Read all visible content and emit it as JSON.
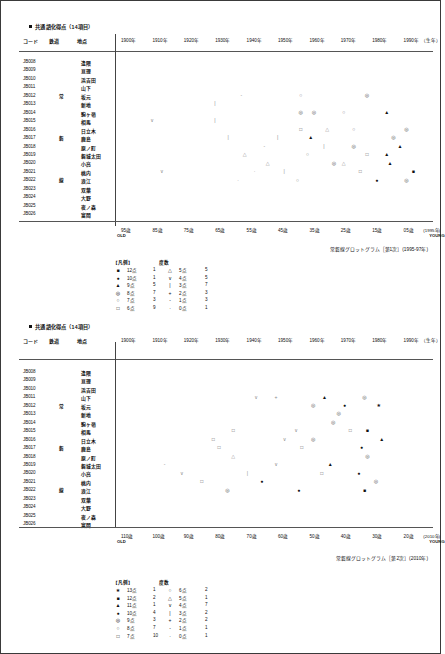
{
  "document": {
    "sections": [
      {
        "id": "sec1",
        "title": "共通語化得点（14項目）",
        "bullet_icon": "filled-square",
        "columns": {
          "code": "コード",
          "railway": "鉄道",
          "place": "地点"
        },
        "year_axis": [
          "1900年",
          "1910年",
          "1920年",
          "1930年",
          "1940年",
          "1950年",
          "1960年",
          "1970年",
          "1980年",
          "1990年"
        ],
        "year_axis_note": "（生年）",
        "age_axis": [
          "95歳",
          "85歳",
          "75歳",
          "65歳",
          "55歳",
          "45歳",
          "35歳",
          "25歳",
          "15歳",
          "05歳"
        ],
        "age_axis_note": "(1995年)",
        "old_label": "OLD",
        "young_label": "YOUNG",
        "caption": "常磐線グロットグラム［第1次］(1995-97年)",
        "rows": [
          {
            "code": "JB008",
            "railway": "",
            "place": "逢隈"
          },
          {
            "code": "JB009",
            "railway": "",
            "place": "亘理"
          },
          {
            "code": "JB010",
            "railway": "",
            "place": "浜吉田"
          },
          {
            "code": "JB011",
            "railway": "",
            "place": "山下"
          },
          {
            "code": "JB012",
            "railway": "常",
            "place": "坂元"
          },
          {
            "code": "JB013",
            "railway": "",
            "place": "新地"
          },
          {
            "code": "JB014",
            "railway": "",
            "place": "駒ヶ嶺"
          },
          {
            "code": "JB015",
            "railway": "",
            "place": "相馬"
          },
          {
            "code": "JB016",
            "railway": "",
            "place": "日立木"
          },
          {
            "code": "JB017",
            "railway": "磐",
            "place": "鹿島"
          },
          {
            "code": "JB018",
            "railway": "",
            "place": "原ノ町"
          },
          {
            "code": "JB019",
            "railway": "",
            "place": "磐城太田"
          },
          {
            "code": "JB020",
            "railway": "",
            "place": "小高"
          },
          {
            "code": "JB021",
            "railway": "",
            "place": "桃内"
          },
          {
            "code": "JB022",
            "railway": "線",
            "place": "浪江"
          },
          {
            "code": "JB023",
            "railway": "",
            "place": "双葉"
          },
          {
            "code": "JB024",
            "railway": "",
            "place": "大野"
          },
          {
            "code": "JB025",
            "railway": "",
            "place": "夜ノ森"
          },
          {
            "code": "JB026",
            "railway": "",
            "place": "富岡"
          }
        ],
        "legend": {
          "header_label": "【凡例】",
          "header_count": "度数",
          "entries": [
            {
              "symbol": "■",
              "score": "12点",
              "count": "1"
            },
            {
              "symbol": "●",
              "score": "10点",
              "count": "1"
            },
            {
              "symbol": "▲",
              "score": "9点",
              "count": "5"
            },
            {
              "symbol": "◎",
              "score": "8点",
              "count": "7"
            },
            {
              "symbol": "○",
              "score": "7点",
              "count": "3"
            },
            {
              "symbol": "□",
              "score": "6点",
              "count": "9"
            },
            {
              "symbol": "△",
              "score": "5点",
              "count": "5"
            },
            {
              "symbol": "∨",
              "score": "4点",
              "count": "5"
            },
            {
              "symbol": "|",
              "score": "3点",
              "count": "7"
            },
            {
              "symbol": "+",
              "score": "2点",
              "count": "3"
            },
            {
              "symbol": "-",
              "score": "1点",
              "count": "3"
            },
            {
              "symbol": "·",
              "score": "0点",
              "count": "1"
            }
          ]
        }
      },
      {
        "id": "sec2",
        "title": "共通語化得点（14項目）",
        "bullet_icon": "filled-square",
        "columns": {
          "code": "コード",
          "railway": "鉄道",
          "place": "地点"
        },
        "year_axis": [
          "1900年",
          "1910年",
          "1920年",
          "1930年",
          "1940年",
          "1950年",
          "1960年",
          "1970年",
          "1980年",
          "1990年"
        ],
        "year_axis_note": "（生年）",
        "age_axis": [
          "110歳",
          "100歳",
          "90歳",
          "80歳",
          "70歳",
          "60歳",
          "50歳",
          "40歳",
          "30歳",
          "20歳"
        ],
        "age_axis_note": "(2010年)",
        "old_label": "OLD",
        "young_label": "YOUNG",
        "caption": "常磐線グロットグラム［第2次］(2010年)",
        "rows": [
          {
            "code": "JB008",
            "railway": "",
            "place": "逢隈"
          },
          {
            "code": "JB009",
            "railway": "",
            "place": "亘理"
          },
          {
            "code": "JB010",
            "railway": "",
            "place": "浜吉田"
          },
          {
            "code": "JB011",
            "railway": "",
            "place": "山下"
          },
          {
            "code": "JB012",
            "railway": "常",
            "place": "坂元"
          },
          {
            "code": "JB013",
            "railway": "",
            "place": "新地"
          },
          {
            "code": "JB014",
            "railway": "",
            "place": "駒ヶ嶺"
          },
          {
            "code": "JB015",
            "railway": "",
            "place": "相馬"
          },
          {
            "code": "JB016",
            "railway": "",
            "place": "日立木"
          },
          {
            "code": "JB017",
            "railway": "磐",
            "place": "鹿島"
          },
          {
            "code": "JB018",
            "railway": "",
            "place": "原ノ町"
          },
          {
            "code": "JB019",
            "railway": "",
            "place": "磐城太田"
          },
          {
            "code": "JB020",
            "railway": "",
            "place": "小高"
          },
          {
            "code": "JB021",
            "railway": "",
            "place": "桃内"
          },
          {
            "code": "JB022",
            "railway": "線",
            "place": "浪江"
          },
          {
            "code": "JB023",
            "railway": "",
            "place": "双葉"
          },
          {
            "code": "JB024",
            "railway": "",
            "place": "大野"
          },
          {
            "code": "JB025",
            "railway": "",
            "place": "夜ノ森"
          },
          {
            "code": "JB026",
            "railway": "",
            "place": "富岡"
          }
        ],
        "legend": {
          "header_label": "【凡例】",
          "header_count": "度数",
          "entries": [
            {
              "symbol": "★",
              "score": "13点",
              "count": "1"
            },
            {
              "symbol": "■",
              "score": "12点",
              "count": "2"
            },
            {
              "symbol": "▲",
              "score": "11点",
              "count": "1"
            },
            {
              "symbol": "●",
              "score": "10点",
              "count": "4"
            },
            {
              "symbol": "◎",
              "score": "9点",
              "count": "3"
            },
            {
              "symbol": "○",
              "score": "8点",
              "count": "7"
            },
            {
              "symbol": "□",
              "score": "7点",
              "count": "10"
            },
            {
              "symbol": "○",
              "score": "6点",
              "count": "2"
            },
            {
              "symbol": "△",
              "score": "5点",
              "count": "1"
            },
            {
              "symbol": "∨",
              "score": "4点",
              "count": "7"
            },
            {
              "symbol": "|",
              "score": "3点",
              "count": "2"
            },
            {
              "symbol": "+",
              "score": "2点",
              "count": "2"
            },
            {
              "symbol": "-",
              "score": "1点",
              "count": "1"
            },
            {
              "symbol": "·",
              "score": "0点",
              "count": "1"
            }
          ]
        }
      }
    ]
  },
  "chart_data": [
    {
      "type": "scatter",
      "title": "常磐線グロットグラム［第1次］(1995-97年)",
      "xlabel": "（生年）",
      "ylabel": "地点",
      "x_ticks": [
        "1900年",
        "1910年",
        "1920年",
        "1930年",
        "1940年",
        "1950年",
        "1960年",
        "1970年",
        "1980年",
        "1990年"
      ],
      "x_ticks_secondary": [
        "95歳",
        "85歳",
        "75歳",
        "65歳",
        "55歳",
        "45歳",
        "35歳",
        "25歳",
        "15歳",
        "05歳"
      ],
      "xlim": [
        1900,
        1995
      ],
      "grid": false,
      "legend_position": "below-left",
      "y_categories": [
        "逢隈",
        "亘理",
        "浜吉田",
        "山下",
        "坂元",
        "新地",
        "駒ヶ嶺",
        "相馬",
        "日立木",
        "鹿島",
        "原ノ町",
        "磐城太田",
        "小高",
        "桃内",
        "浪江",
        "双葉",
        "大野",
        "夜ノ森",
        "富岡"
      ],
      "points": [
        {
          "row": "坂元",
          "x": 1937,
          "symbol": "-"
        },
        {
          "row": "坂元",
          "x": 1955,
          "symbol": "○"
        },
        {
          "row": "坂元",
          "x": 1975,
          "symbol": "◎"
        },
        {
          "row": "新地",
          "x": 1929,
          "symbol": "|"
        },
        {
          "row": "駒ヶ嶺",
          "x": 1955,
          "symbol": "◎"
        },
        {
          "row": "駒ヶ嶺",
          "x": 1959,
          "symbol": "◎"
        },
        {
          "row": "駒ヶ嶺",
          "x": 1968,
          "symbol": "○"
        },
        {
          "row": "駒ヶ嶺",
          "x": 1981,
          "symbol": "▲"
        },
        {
          "row": "相馬",
          "x": 1910,
          "symbol": "∨"
        },
        {
          "row": "相馬",
          "x": 1929,
          "symbol": "|"
        },
        {
          "row": "日立木",
          "x": 1955,
          "symbol": "□"
        },
        {
          "row": "日立木",
          "x": 1963,
          "symbol": "△"
        },
        {
          "row": "日立木",
          "x": 1971,
          "symbol": "○"
        },
        {
          "row": "日立木",
          "x": 1987,
          "symbol": "◎"
        },
        {
          "row": "鹿島",
          "x": 1933,
          "symbol": "|"
        },
        {
          "row": "鹿島",
          "x": 1948,
          "symbol": "|"
        },
        {
          "row": "鹿島",
          "x": 1958,
          "symbol": "▲"
        },
        {
          "row": "鹿島",
          "x": 1983,
          "symbol": "◎"
        },
        {
          "row": "原ノ町",
          "x": 1944,
          "symbol": "-"
        },
        {
          "row": "原ノ町",
          "x": 1962,
          "symbol": "|"
        },
        {
          "row": "原ノ町",
          "x": 1971,
          "symbol": "◎"
        },
        {
          "row": "原ノ町",
          "x": 1985,
          "symbol": "▲"
        },
        {
          "row": "磐城太田",
          "x": 1938,
          "symbol": "△"
        },
        {
          "row": "磐城太田",
          "x": 1957,
          "symbol": "○"
        },
        {
          "row": "磐城太田",
          "x": 1975,
          "symbol": "□"
        },
        {
          "row": "磐城太田",
          "x": 1981,
          "symbol": "▲"
        },
        {
          "row": "小高",
          "x": 1945,
          "symbol": "△"
        },
        {
          "row": "小高",
          "x": 1965,
          "symbol": "◎"
        },
        {
          "row": "小高",
          "x": 1968,
          "symbol": "△"
        },
        {
          "row": "小高",
          "x": 1982,
          "symbol": "▲"
        },
        {
          "row": "桃内",
          "x": 1913,
          "symbol": "∨"
        },
        {
          "row": "桃内",
          "x": 1941,
          "symbol": "·"
        },
        {
          "row": "桃内",
          "x": 1950,
          "symbol": "|"
        },
        {
          "row": "桃内",
          "x": 1973,
          "symbol": "□"
        },
        {
          "row": "桃内",
          "x": 1989,
          "symbol": "■"
        },
        {
          "row": "浪江",
          "x": 1936,
          "symbol": "·"
        },
        {
          "row": "浪江",
          "x": 1954,
          "symbol": "○"
        },
        {
          "row": "浪江",
          "x": 1978,
          "symbol": "●"
        },
        {
          "row": "浪江",
          "x": 1987,
          "symbol": "◎"
        }
      ]
    },
    {
      "type": "scatter",
      "title": "常磐線グロットグラム［第2次］(2010年)",
      "xlabel": "（生年）",
      "ylabel": "地点",
      "x_ticks": [
        "1900年",
        "1910年",
        "1920年",
        "1930年",
        "1940年",
        "1950年",
        "1960年",
        "1970年",
        "1980年",
        "1990年"
      ],
      "x_ticks_secondary": [
        "110歳",
        "100歳",
        "90歳",
        "80歳",
        "70歳",
        "60歳",
        "50歳",
        "40歳",
        "30歳",
        "20歳"
      ],
      "xlim": [
        1900,
        2010
      ],
      "grid": false,
      "legend_position": "below-left",
      "y_categories": [
        "逢隈",
        "亘理",
        "浜吉田",
        "山下",
        "坂元",
        "新地",
        "駒ヶ嶺",
        "相馬",
        "日立木",
        "鹿島",
        "原ノ町",
        "磐城太田",
        "小高",
        "桃内",
        "浪江",
        "双葉",
        "大野",
        "夜ノ森",
        "富岡"
      ],
      "points": [
        {
          "row": "山下",
          "x": 1948,
          "symbol": "∨"
        },
        {
          "row": "山下",
          "x": 1955,
          "symbol": "+"
        },
        {
          "row": "山下",
          "x": 1972,
          "symbol": "▲"
        },
        {
          "row": "山下",
          "x": 1986,
          "symbol": "◎"
        },
        {
          "row": "坂元",
          "x": 1968,
          "symbol": "◎"
        },
        {
          "row": "坂元",
          "x": 1979,
          "symbol": "●"
        },
        {
          "row": "坂元",
          "x": 1991,
          "symbol": "★"
        },
        {
          "row": "新地",
          "x": 1977,
          "symbol": "◎"
        },
        {
          "row": "駒ヶ嶺",
          "x": 1975,
          "symbol": "◎"
        },
        {
          "row": "相馬",
          "x": 1940,
          "symbol": "□"
        },
        {
          "row": "相馬",
          "x": 1962,
          "symbol": "∨"
        },
        {
          "row": "相馬",
          "x": 1981,
          "symbol": "□"
        },
        {
          "row": "相馬",
          "x": 1987,
          "symbol": "■"
        },
        {
          "row": "日立木",
          "x": 1933,
          "symbol": "□"
        },
        {
          "row": "日立木",
          "x": 1958,
          "symbol": "∨"
        },
        {
          "row": "日立木",
          "x": 1968,
          "symbol": "◎"
        },
        {
          "row": "日立木",
          "x": 1992,
          "symbol": "▲"
        },
        {
          "row": "鹿島",
          "x": 1935,
          "symbol": "□"
        },
        {
          "row": "鹿島",
          "x": 1964,
          "symbol": "□"
        },
        {
          "row": "鹿島",
          "x": 1985,
          "symbol": "●"
        },
        {
          "row": "原ノ町",
          "x": 1940,
          "symbol": "△"
        },
        {
          "row": "原ノ町",
          "x": 1987,
          "symbol": "◎"
        },
        {
          "row": "磐城太田",
          "x": 1916,
          "symbol": "-"
        },
        {
          "row": "磐城太田",
          "x": 1955,
          "symbol": "∨"
        },
        {
          "row": "磐城太田",
          "x": 1974,
          "symbol": "▲"
        },
        {
          "row": "小高",
          "x": 1922,
          "symbol": "∨"
        },
        {
          "row": "小高",
          "x": 1945,
          "symbol": "|"
        },
        {
          "row": "小高",
          "x": 1971,
          "symbol": "□"
        },
        {
          "row": "小高",
          "x": 1984,
          "symbol": "●"
        },
        {
          "row": "桃内",
          "x": 1929,
          "symbol": "□"
        },
        {
          "row": "桃内",
          "x": 1950,
          "symbol": "●"
        },
        {
          "row": "桃内",
          "x": 1990,
          "symbol": "◎"
        },
        {
          "row": "浪江",
          "x": 1938,
          "symbol": "◎"
        },
        {
          "row": "浪江",
          "x": 1963,
          "symbol": "●"
        },
        {
          "row": "浪江",
          "x": 1986,
          "symbol": "■"
        }
      ]
    }
  ]
}
